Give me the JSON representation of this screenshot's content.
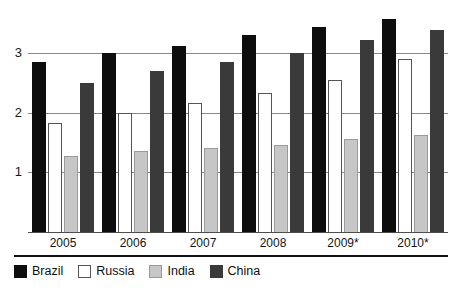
{
  "chart_data": {
    "type": "bar",
    "title": "",
    "subtitle": "",
    "xlabel": "",
    "ylabel": "",
    "categories": [
      "2005",
      "2006",
      "2007",
      "2008",
      "2009*",
      "2010*"
    ],
    "ylim": [
      0,
      3.75
    ],
    "yticks": [
      1,
      2,
      3
    ],
    "ytick_labels": [
      "1",
      "2",
      "3"
    ],
    "grid": true,
    "legend_position": "bottom-left",
    "series": [
      {
        "name": "Brazil",
        "color": "#0d0d0d",
        "values": [
          2.85,
          3.0,
          3.12,
          3.3,
          3.44,
          3.57
        ]
      },
      {
        "name": "Russia",
        "color": "#ffffff",
        "values": [
          1.82,
          2.0,
          2.16,
          2.32,
          2.55,
          2.9
        ]
      },
      {
        "name": "India",
        "color": "#c6c6c6",
        "values": [
          1.27,
          1.35,
          1.4,
          1.46,
          1.55,
          1.63
        ]
      },
      {
        "name": "China",
        "color": "#3a3a3a",
        "values": [
          2.5,
          2.7,
          2.85,
          3.0,
          3.22,
          3.38
        ]
      }
    ]
  },
  "legend": {
    "items": [
      {
        "label": "Brazil",
        "key": "brazil"
      },
      {
        "label": "Russia",
        "key": "russia"
      },
      {
        "label": "India",
        "key": "india"
      },
      {
        "label": "China",
        "key": "china"
      }
    ]
  }
}
